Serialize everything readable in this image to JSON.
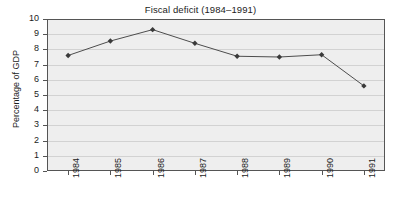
{
  "chart_data": {
    "type": "line",
    "title": "Fiscal deficit (1984–1991)",
    "xlabel": "",
    "ylabel": "Percentage of GDP",
    "categories": [
      "1984",
      "1985",
      "1986",
      "1987",
      "1988",
      "1989",
      "1990",
      "1991"
    ],
    "values": [
      7.6,
      8.55,
      9.3,
      8.4,
      7.55,
      7.5,
      7.65,
      5.6
    ],
    "series": [
      {
        "name": "Fiscal deficit",
        "values": [
          7.6,
          8.55,
          9.3,
          8.4,
          7.55,
          7.5,
          7.65,
          5.6
        ]
      }
    ],
    "ylim": [
      0,
      10
    ],
    "ytick_labels": [
      "10",
      "9",
      "8",
      "7",
      "6",
      "5",
      "4",
      "3",
      "2",
      "1",
      "0"
    ],
    "ytick_values": [
      10,
      9,
      8,
      7,
      6,
      5,
      4,
      3,
      2,
      1,
      0
    ],
    "grid": true,
    "legend": false,
    "legend_position": "none",
    "marker": "diamond",
    "line_color": "#4d4d4d",
    "marker_color": "#3a3a3a",
    "plot_background": "#eeeeee",
    "gridline_color": "#d2d2d2",
    "axis_color": "#555555",
    "text_color": "#1c1c1c"
  }
}
